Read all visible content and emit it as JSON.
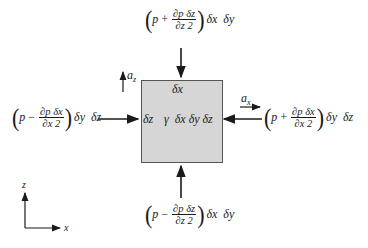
{
  "diagram": {
    "element": {
      "top_label": "δx",
      "left_label": "δz",
      "center_label": "γ  δx δy δz",
      "fill": "#d6d6d6"
    },
    "forces": {
      "top": {
        "pre": "p",
        "op": "+",
        "num": "∂p δz",
        "den": "∂z 2",
        "tail": "δx  δy"
      },
      "bottom": {
        "pre": "p",
        "op": "−",
        "num": "∂p δz",
        "den": "∂z 2",
        "tail": "δx  δy"
      },
      "left": {
        "pre": "p",
        "op": "−",
        "num": "∂p δx",
        "den": "∂x 2",
        "tail": "δy  δz"
      },
      "right": {
        "pre": "p",
        "op": "+",
        "num": "∂p δx",
        "den": "∂x 2",
        "tail": "δy  δz"
      }
    },
    "accelerations": {
      "az": "a",
      "az_sub": "z",
      "ax": "a",
      "ax_sub": "x"
    },
    "axes": {
      "vertical": "z",
      "horizontal": "x"
    }
  }
}
